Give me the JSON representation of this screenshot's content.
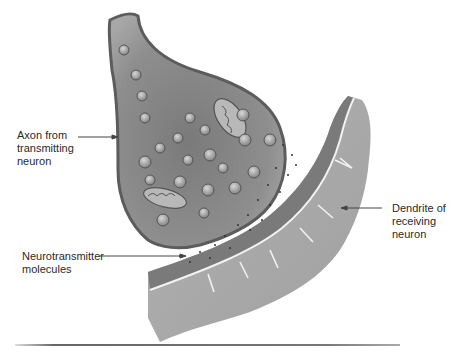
{
  "figure": {
    "labels": {
      "axon": "Axon from\ntransmitting\nneuron",
      "dendrite": "Dendrite of\nreceiving\nneuron",
      "neurotransmitter": "Neurotransmitter\nmolecules"
    },
    "colors": {
      "axon_fill": "#8a8a8a",
      "axon_edge": "#5c5c5c",
      "dendrite_fill": "#a9a9a9",
      "membrane_dark": "#6e6e6e",
      "label_text": "#2a2a2a",
      "background": "#ffffff"
    }
  }
}
